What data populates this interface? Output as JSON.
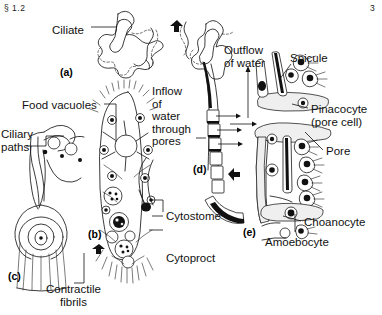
{
  "header": {
    "section": "§ 1.2",
    "page_number": "3"
  },
  "figure": {
    "panels": [
      {
        "id": "(a)",
        "x": 60,
        "y": 66
      },
      {
        "id": "(b)",
        "x": 88,
        "y": 228
      },
      {
        "id": "(c)",
        "x": 8,
        "y": 270
      },
      {
        "id": "(d)",
        "x": 193,
        "y": 163
      },
      {
        "id": "(e)",
        "x": 243,
        "y": 226
      }
    ],
    "labels": [
      {
        "name": "ciliate",
        "text": "Ciliate",
        "x": 52,
        "y": 24
      },
      {
        "name": "food-vacuoles",
        "text": "Food vacuoles",
        "x": 22,
        "y": 99
      },
      {
        "name": "ciliary-paths",
        "text": "Ciliary\npaths",
        "x": 1,
        "y": 128
      },
      {
        "name": "contractile-fibrils",
        "text": "Contractile\nfibrils",
        "x": 46,
        "y": 283
      },
      {
        "name": "cytostome",
        "text": "Cytostome",
        "x": 166,
        "y": 210
      },
      {
        "name": "cytoproct",
        "text": "Cytoproct",
        "x": 166,
        "y": 252
      },
      {
        "name": "inflow-of-water",
        "text": "Inflow\nof\nwater\nthrough\npores",
        "x": 152,
        "y": 85
      },
      {
        "name": "outflow-of-water",
        "text": "Outflow\nof water",
        "x": 224,
        "y": 44
      },
      {
        "name": "spicule",
        "text": "Spicule",
        "x": 290,
        "y": 52
      },
      {
        "name": "pinacocyte",
        "text": "Pinacocyte\n(pore cell)",
        "x": 311,
        "y": 103
      },
      {
        "name": "pore",
        "text": "Pore",
        "x": 326,
        "y": 145
      },
      {
        "name": "choanocyte",
        "text": "Choanocyte",
        "x": 304,
        "y": 216
      },
      {
        "name": "amoebocyte",
        "text": "Amoebocyte",
        "x": 265,
        "y": 236
      }
    ]
  }
}
